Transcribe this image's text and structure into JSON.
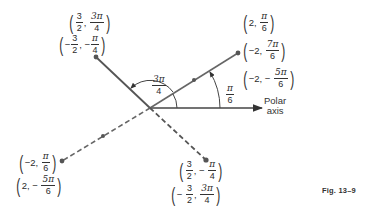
{
  "diagram": {
    "figure_label": "Fig. 13–9",
    "axis": {
      "label_line1": "Polar",
      "label_line2": "axis"
    },
    "angles": [
      {
        "id": "pi-over-6",
        "num": "π",
        "den": "6"
      },
      {
        "id": "three-pi-over-4",
        "num": "3π",
        "den": "4"
      }
    ],
    "points": [
      {
        "id": "upper-left",
        "style": "solid",
        "labels": [
          {
            "sign": "",
            "r_num": "3",
            "r_den": "2",
            "theta_num": "3π",
            "theta_den": "4",
            "theta_sign": ""
          },
          {
            "sign": "−",
            "r_num": "3",
            "r_den": "2",
            "theta_num": "π",
            "theta_den": "4",
            "theta_sign": "−"
          }
        ]
      },
      {
        "id": "upper-right",
        "style": "solid",
        "labels": [
          {
            "r": "2",
            "theta_num": "π",
            "theta_den": "6",
            "theta_sign": ""
          },
          {
            "r": "−2",
            "theta_num": "7π",
            "theta_den": "6",
            "theta_sign": ""
          },
          {
            "r": "−2",
            "theta_num": "5π",
            "theta_den": "6",
            "theta_sign": "−"
          }
        ]
      },
      {
        "id": "lower-left",
        "style": "dashed",
        "labels": [
          {
            "r": "−2",
            "theta_num": "π",
            "theta_den": "6",
            "theta_sign": ""
          },
          {
            "r": "2",
            "theta_num": "5π",
            "theta_den": "6",
            "theta_sign": "−"
          }
        ]
      },
      {
        "id": "lower-right",
        "style": "dashed",
        "labels": [
          {
            "sign": "",
            "r_num": "3",
            "r_den": "2",
            "theta_num": "π",
            "theta_den": "4",
            "theta_sign": "−"
          },
          {
            "sign": "−",
            "r_num": "3",
            "r_den": "2",
            "theta_num": "3π",
            "theta_den": "4",
            "theta_sign": ""
          }
        ]
      }
    ]
  },
  "colors": {
    "line": "#555555",
    "text": "#2b2b2b",
    "background": "#ffffff"
  }
}
